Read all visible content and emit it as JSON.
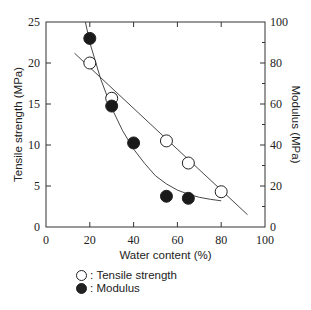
{
  "chart_data": {
    "type": "scatter",
    "title": "",
    "xlabel": "Water content (%)",
    "ylabel": "Tensile strength (MPa)",
    "y2label": "Modulus (MPa)",
    "xlim": [
      0,
      100
    ],
    "ylim": [
      0,
      25
    ],
    "y2lim": [
      0,
      100
    ],
    "x_ticks": [
      "0",
      "20",
      "40",
      "60",
      "80",
      "100"
    ],
    "y_ticks": [
      "0",
      "5",
      "10",
      "15",
      "20",
      "25"
    ],
    "y2_ticks": [
      "0",
      "20",
      "40",
      "60",
      "80",
      "100"
    ],
    "grid": false,
    "legend_position": "below",
    "series": [
      {
        "name": "Tensile strength",
        "marker": "open-circle",
        "axis": "left",
        "x": [
          20,
          30,
          55,
          65,
          80
        ],
        "y": [
          20,
          15.7,
          10.5,
          7.8,
          4.3
        ],
        "fit": "linear",
        "fit_x": [
          13,
          92
        ],
        "fit_y": [
          21.2,
          1.5
        ]
      },
      {
        "name": "Modulus",
        "marker": "filled-circle",
        "axis": "right",
        "x": [
          20,
          30,
          40,
          55,
          65
        ],
        "y": [
          92,
          59,
          41,
          15,
          14
        ],
        "fit": "curve",
        "fit_x": [
          18,
          20,
          25,
          30,
          35,
          40,
          45,
          50,
          55,
          60,
          65,
          70,
          75,
          80
        ],
        "fit_y": [
          100,
          90,
          72,
          58,
          47,
          38,
          31,
          25,
          21,
          18,
          16,
          14.5,
          13.5,
          12.8
        ]
      }
    ]
  },
  "legend": {
    "items": [
      {
        "symbol": "○",
        "sep": ":",
        "label": "Tensile strength"
      },
      {
        "symbol": "●",
        "sep": ":",
        "label": "Modulus"
      }
    ]
  }
}
